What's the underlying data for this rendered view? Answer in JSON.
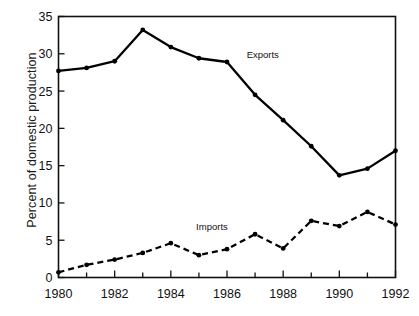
{
  "chart_data": {
    "type": "line",
    "title": "",
    "xlabel": "",
    "ylabel": "Percent of domestic production",
    "xlim": [
      1980,
      1992
    ],
    "ylim": [
      0,
      35
    ],
    "yticks": [
      0,
      5,
      10,
      15,
      20,
      25,
      30,
      35
    ],
    "ytick_labels": [
      "0",
      "5",
      "10",
      "15",
      "20",
      "25",
      "30",
      "35"
    ],
    "xticks": [
      1980,
      1981,
      1982,
      1983,
      1984,
      1985,
      1986,
      1987,
      1988,
      1989,
      1990,
      1991,
      1992
    ],
    "xtick_labels": [
      "1980",
      "",
      "1982",
      "",
      "1984",
      "",
      "1986",
      "",
      "1988",
      "",
      "1990",
      "",
      "1992"
    ],
    "x_major_labels": [
      "1980",
      "1982",
      "1984",
      "1986",
      "1988",
      "1990",
      "1992"
    ],
    "grid": false,
    "legend_position": "inline-annotation",
    "x": [
      1980,
      1981,
      1982,
      1983,
      1984,
      1985,
      1986,
      1987,
      1988,
      1989,
      1990,
      1991,
      1992
    ],
    "series": [
      {
        "name": "Exports",
        "style": "solid",
        "color": "#000000",
        "marker": "circle",
        "label_x": 1986.7,
        "label_y": 29.5,
        "values": [
          27.7,
          28.1,
          29.0,
          33.2,
          30.9,
          29.4,
          28.9,
          24.5,
          21.1,
          17.6,
          13.7,
          14.6,
          17.0
        ]
      },
      {
        "name": "Imports",
        "style": "dashed",
        "color": "#000000",
        "marker": "circle",
        "label_x": 1984.9,
        "label_y": 6.4,
        "values": [
          0.7,
          1.7,
          2.4,
          3.3,
          4.6,
          3.0,
          3.8,
          5.8,
          3.9,
          7.6,
          6.9,
          8.8,
          7.1
        ]
      }
    ],
    "axis_color": "#111111",
    "background_color": "#ffffff"
  }
}
